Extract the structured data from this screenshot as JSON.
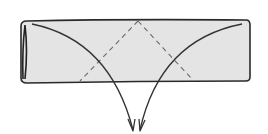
{
  "diagram": {
    "type": "folding-instruction",
    "description": "Rolled paper strip with two diagonal dashed fold lines meeting at top center; two curved arrows indicating both ends folded down",
    "colors": {
      "paper_fill": "#e4e4e4",
      "outline": "#2a2a2a",
      "fold_line": "#6a6a6a",
      "arrow": "#333333",
      "background": "#ffffff"
    },
    "elements": {
      "strip": {
        "label": "paper-strip",
        "shape": "rounded-rectangle"
      },
      "tube_end": {
        "label": "rolled-end",
        "side": "left"
      },
      "fold_lines": [
        {
          "label": "valley-fold-left",
          "style": "dashed"
        },
        {
          "label": "valley-fold-right",
          "style": "dashed"
        }
      ],
      "arrows": [
        {
          "label": "fold-arrow-left",
          "direction": "down"
        },
        {
          "label": "fold-arrow-right",
          "direction": "down"
        }
      ]
    }
  }
}
